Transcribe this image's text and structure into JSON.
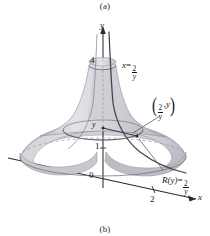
{
  "figure": {
    "caption_top": "(a)",
    "caption_bottom": "(b)"
  },
  "axes": {
    "y_axis_label": "y",
    "x_axis_label": "x",
    "origin_label": "0",
    "ticks": {
      "y_one": "1",
      "y_four": "4",
      "x_two": "2"
    },
    "variable_marker": "y"
  },
  "annotations": {
    "curve_equation": {
      "lhs": "x",
      "equals": "=",
      "numerator": "2",
      "denominator": "y"
    },
    "point_label": {
      "open_paren": "(",
      "numerator": "2",
      "denominator": "y",
      "comma": ",",
      "second": "y",
      "close_paren": ")"
    },
    "radius_function": {
      "lhs": "R(y)",
      "equals": "=",
      "numerator": "2",
      "denominator": "y"
    }
  },
  "colors": {
    "axis": "#2b2b2b",
    "curve": "#4a4a52",
    "surface_light": "#d9d9dd",
    "surface_mid": "#c9c9cf",
    "surface_dark": "#b6b6bd",
    "text": "#141414",
    "leader": "#55555c",
    "background": "#ffffff"
  }
}
